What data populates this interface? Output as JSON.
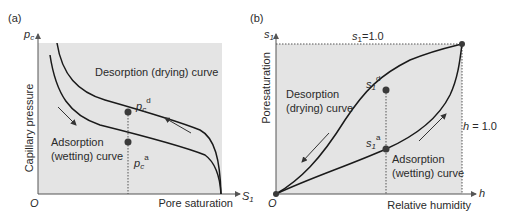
{
  "panel_a": {
    "tag": "(a)",
    "y_axis_symbol": "p",
    "y_axis_symbol_sub": "c",
    "y_axis_label": "Capillary pressure",
    "x_axis_symbol": "S",
    "x_axis_symbol_sub": "1",
    "x_axis_label": "Pore saturation",
    "origin_label": "O",
    "desorption_label": "Desorption (drying) curve",
    "adsorption_label_line1": "Adsorption",
    "adsorption_label_line2": "(wetting) curve",
    "point_d_base": "p",
    "point_d_sub": "c",
    "point_d_sup": "d",
    "point_a_base": "p",
    "point_a_sub": "c",
    "point_a_sup": "a"
  },
  "panel_b": {
    "tag": "(b)",
    "y_axis_symbol": "s",
    "y_axis_symbol_sub": "1",
    "y_axis_label": "Poresaturation",
    "x_axis_symbol": "h",
    "x_axis_label": "Relative humidity",
    "origin_label": "O",
    "top_line_label_base": "s",
    "top_line_label_sub": "1",
    "top_line_label_value": "=1.0",
    "right_line_label_base": "h",
    "right_line_label_value": " = 1.0",
    "desorption_label_line1": "Desorption",
    "desorption_label_line2": "(drying) curve",
    "adsorption_label_line1": "Adsorption",
    "adsorption_label_line2": "(wetting) curve",
    "point_d_base": "s",
    "point_d_sub": "1",
    "point_d_sup": "d",
    "point_a_base": "s",
    "point_a_sub": "1",
    "point_a_sup": "a"
  },
  "colors": {
    "panel_fill": "#e4e4e4",
    "curve": "#1a1a1a",
    "point": "#3a3a3a",
    "text": "#2a2a2a"
  }
}
